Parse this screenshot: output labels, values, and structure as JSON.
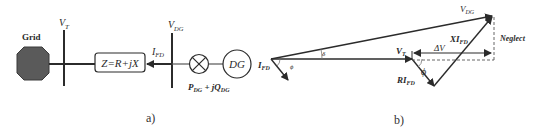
{
  "figure": {
    "panel_a": {
      "caption": "a)",
      "grid_label": "Grid",
      "vt_label": "V",
      "vt_sub": "T",
      "impedance_label": "Z=R+jX",
      "ifd_label": "I",
      "ifd_sub": "FD",
      "vdg_label": "V",
      "vdg_sub": "DG",
      "dg_label": "DG",
      "power_p": "P",
      "power_p_sub": "DG",
      "power_mid": " + jQ",
      "power_q_sub": "DG",
      "colors": {
        "line": "#2b2b2b",
        "grid_fill": "#5a5a5a"
      }
    },
    "panel_b": {
      "caption": "b)",
      "vdg_label": "V",
      "vdg_sub": "DG",
      "neglect_label": "Neglect",
      "xifd_label": "XI",
      "xifd_sub": "FD",
      "delta_v_label": "ΔV",
      "vt_label": "V",
      "vt_sub": "T",
      "rifd_label": "RI",
      "rifd_sub": "FD",
      "phi_label": "ϕ",
      "phi_small_label": "ϕ",
      "delta_label": "δ",
      "ifd_label": "I",
      "ifd_sub": "FD",
      "colors": {
        "line": "#2b2b2b",
        "dashed": "#555555"
      }
    }
  }
}
